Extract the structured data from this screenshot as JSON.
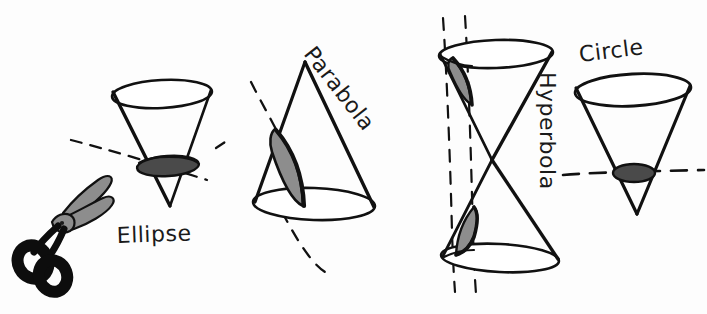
{
  "figure": {
    "background_color": "#fdfdfd",
    "ink_color": "#111111",
    "style": "hand-drawn-sketch"
  },
  "palette": {
    "ink": "#111111",
    "shade_dark": "#4a4a4a",
    "shade_mid": "#8d8d8d",
    "shade_light": "#a6a6a6",
    "scissors_handle": "#0d0d0d",
    "scissors_blade": "#8d8d8d",
    "paper": "#fdfdfd"
  },
  "labels": {
    "ellipse": "Ellipse",
    "parabola": "Parabola",
    "hyperbola": "Hyperbola",
    "circle": "Circle"
  },
  "figures": [
    {
      "id": "scissors",
      "name": "scissors",
      "label": "",
      "description": "open scissors with black handles and gray blades",
      "x": 14,
      "y": 175,
      "width": 100,
      "height": 115
    },
    {
      "id": "ellipse-cone",
      "name": "ellipse-cone",
      "label": "Ellipse",
      "description": "inverted cone cut by an oblique plane producing an ellipse",
      "cut_angle": "oblique",
      "section_shape": "ellipse",
      "section_fill": "#4a4a4a",
      "x": 105,
      "y": 82,
      "width": 115,
      "height": 125
    },
    {
      "id": "parabola-cone",
      "name": "parabola-cone",
      "label": "Parabola",
      "description": "upright cone cut by a plane parallel to a side producing a parabola",
      "cut_angle": "parallel-to-slant",
      "section_shape": "parabola",
      "section_fill": "#8d8d8d",
      "x": 245,
      "y": 58,
      "width": 140,
      "height": 165
    },
    {
      "id": "hyperbola-double-cone",
      "name": "hyperbola-double-cone",
      "label": "Hyperbola",
      "description": "double napped cone cut by a vertical plane producing a hyperbola",
      "cut_angle": "vertical",
      "section_shape": "hyperbola",
      "section_fill": "#8d8d8d",
      "x": 432,
      "y": 20,
      "width": 130,
      "height": 270
    },
    {
      "id": "circle-cone",
      "name": "circle-cone",
      "label": "Circle",
      "description": "inverted cone cut by a horizontal plane producing a circle",
      "cut_angle": "horizontal",
      "section_shape": "circle",
      "section_fill": "#4a4a4a",
      "x": 570,
      "y": 62,
      "width": 125,
      "height": 155
    }
  ],
  "cutting_planes": [
    {
      "id": "ellipse-plane",
      "name": "ellipse-cutting-plane",
      "orientation": "oblique-descending",
      "style": "dashed"
    },
    {
      "id": "parabola-plane",
      "name": "parabola-cutting-plane",
      "orientation": "steep-oblique",
      "style": "dashed"
    },
    {
      "id": "hyperbola-plane",
      "name": "hyperbola-cutting-plane",
      "orientation": "vertical-pair",
      "style": "dashed"
    },
    {
      "id": "circle-plane",
      "name": "circle-cutting-plane",
      "orientation": "horizontal",
      "style": "dashed"
    }
  ],
  "label_positions": {
    "ellipse": {
      "x": 117,
      "y": 243,
      "rotate": -2
    },
    "parabola": {
      "x": 303,
      "y": 54,
      "rotate": 52
    },
    "hyperbola": {
      "x": 540,
      "y": 72,
      "rotate": 90
    },
    "circle": {
      "x": 580,
      "y": 62,
      "rotate": -7
    }
  }
}
